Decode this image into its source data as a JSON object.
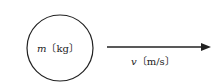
{
  "diagram": {
    "object": {
      "symbol": "m",
      "unit": "〔kg〕"
    },
    "velocity": {
      "symbol": "v",
      "unit": "〔m/s〕"
    }
  }
}
